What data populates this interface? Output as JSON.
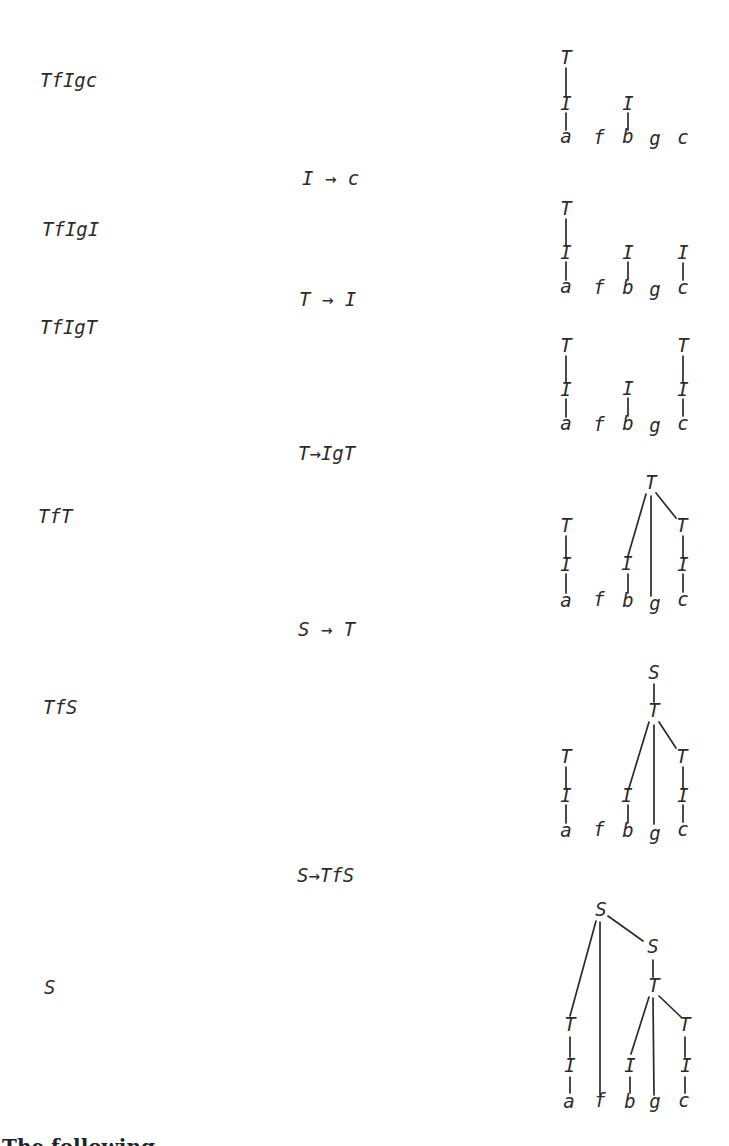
{
  "style": {
    "background": "#ffffff",
    "ink": "#2b2b2b",
    "edge_width": 1.7,
    "node_font_px": 19
  },
  "derivation": {
    "terminal_string": "afbgc",
    "terminals": [
      "a",
      "f",
      "b",
      "g",
      "c"
    ],
    "steps": [
      {
        "form": "TfIgc"
      },
      {
        "form": "TfIgI"
      },
      {
        "form": "TfIgT"
      },
      {
        "form": "TfT"
      },
      {
        "form": "TfS"
      },
      {
        "form": "S"
      }
    ],
    "rules": [
      {
        "text": "I → c"
      },
      {
        "text": "T → I"
      },
      {
        "text": "T→IgT"
      },
      {
        "text": "S → T"
      },
      {
        "text": "S→TfS"
      }
    ]
  },
  "caption": {
    "visible_fragment": "The following"
  },
  "trees": [
    {
      "name": "tree-step-1-TfIgc",
      "nodes": [
        {
          "label": "T",
          "x": 566,
          "y": 64
        },
        {
          "label": "I",
          "x": 566,
          "y": 110
        },
        {
          "label": "a",
          "x": 566,
          "y": 143
        },
        {
          "label": "f",
          "x": 599,
          "y": 144
        },
        {
          "label": "I",
          "x": 628,
          "y": 110
        },
        {
          "label": "b",
          "x": 628,
          "y": 143
        },
        {
          "label": "g",
          "x": 655,
          "y": 145
        },
        {
          "label": "c",
          "x": 683,
          "y": 144
        }
      ],
      "edges": [
        [
          566,
          68,
          566,
          96
        ],
        [
          566,
          113,
          566,
          130
        ],
        [
          628,
          113,
          628,
          130
        ]
      ]
    },
    {
      "name": "tree-step-2-TfIgI",
      "nodes": [
        {
          "label": "T",
          "x": 566,
          "y": 215
        },
        {
          "label": "I",
          "x": 566,
          "y": 259
        },
        {
          "label": "a",
          "x": 566,
          "y": 293
        },
        {
          "label": "f",
          "x": 599,
          "y": 294
        },
        {
          "label": "I",
          "x": 628,
          "y": 259
        },
        {
          "label": "b",
          "x": 628,
          "y": 294
        },
        {
          "label": "g",
          "x": 655,
          "y": 296
        },
        {
          "label": "I",
          "x": 683,
          "y": 259
        },
        {
          "label": "c",
          "x": 683,
          "y": 294
        }
      ],
      "edges": [
        [
          566,
          219,
          566,
          245
        ],
        [
          566,
          262,
          566,
          280
        ],
        [
          628,
          262,
          628,
          280
        ],
        [
          683,
          263,
          683,
          280
        ]
      ]
    },
    {
      "name": "tree-step-3-TfIgT",
      "nodes": [
        {
          "label": "T",
          "x": 566,
          "y": 352
        },
        {
          "label": "I",
          "x": 566,
          "y": 396
        },
        {
          "label": "a",
          "x": 566,
          "y": 430
        },
        {
          "label": "f",
          "x": 599,
          "y": 431
        },
        {
          "label": "I",
          "x": 628,
          "y": 395
        },
        {
          "label": "b",
          "x": 628,
          "y": 430
        },
        {
          "label": "g",
          "x": 655,
          "y": 432
        },
        {
          "label": "T",
          "x": 683,
          "y": 352
        },
        {
          "label": "I",
          "x": 683,
          "y": 396
        },
        {
          "label": "c",
          "x": 683,
          "y": 430
        }
      ],
      "edges": [
        [
          566,
          356,
          566,
          382
        ],
        [
          566,
          399,
          566,
          417
        ],
        [
          628,
          398,
          628,
          416
        ],
        [
          683,
          356,
          683,
          382
        ],
        [
          683,
          399,
          683,
          416
        ]
      ]
    },
    {
      "name": "tree-step-4-TfT",
      "nodes": [
        {
          "label": "T",
          "x": 651,
          "y": 489
        },
        {
          "label": "T",
          "x": 566,
          "y": 532
        },
        {
          "label": "I",
          "x": 566,
          "y": 571
        },
        {
          "label": "a",
          "x": 566,
          "y": 607
        },
        {
          "label": "f",
          "x": 599,
          "y": 606
        },
        {
          "label": "I",
          "x": 627,
          "y": 570
        },
        {
          "label": "b",
          "x": 628,
          "y": 607
        },
        {
          "label": "g",
          "x": 655,
          "y": 610
        },
        {
          "label": "T",
          "x": 682,
          "y": 532
        },
        {
          "label": "I",
          "x": 683,
          "y": 571
        },
        {
          "label": "c",
          "x": 683,
          "y": 606
        }
      ],
      "edges": [
        [
          646,
          494,
          628,
          556
        ],
        [
          651,
          496,
          651,
          596
        ],
        [
          656,
          493,
          676,
          518
        ],
        [
          566,
          536,
          566,
          558
        ],
        [
          566,
          574,
          566,
          593
        ],
        [
          628,
          574,
          628,
          593
        ],
        [
          683,
          536,
          683,
          557
        ],
        [
          683,
          574,
          683,
          592
        ]
      ]
    },
    {
      "name": "tree-step-5-TfS",
      "nodes": [
        {
          "label": "S",
          "x": 654,
          "y": 679
        },
        {
          "label": "T",
          "x": 654,
          "y": 717
        },
        {
          "label": "T",
          "x": 566,
          "y": 763
        },
        {
          "label": "I",
          "x": 566,
          "y": 802
        },
        {
          "label": "a",
          "x": 566,
          "y": 837
        },
        {
          "label": "f",
          "x": 599,
          "y": 836
        },
        {
          "label": "I",
          "x": 627,
          "y": 802
        },
        {
          "label": "b",
          "x": 628,
          "y": 837
        },
        {
          "label": "g",
          "x": 655,
          "y": 840
        },
        {
          "label": "T",
          "x": 682,
          "y": 763
        },
        {
          "label": "I",
          "x": 683,
          "y": 802
        },
        {
          "label": "c",
          "x": 683,
          "y": 836
        }
      ],
      "edges": [
        [
          654,
          684,
          654,
          702
        ],
        [
          649,
          722,
          629,
          788
        ],
        [
          654,
          725,
          654,
          824
        ],
        [
          659,
          722,
          676,
          748
        ],
        [
          566,
          767,
          566,
          789
        ],
        [
          566,
          805,
          566,
          823
        ],
        [
          628,
          805,
          628,
          823
        ],
        [
          683,
          767,
          683,
          789
        ],
        [
          683,
          805,
          683,
          822
        ]
      ]
    },
    {
      "name": "tree-step-6-S",
      "nodes": [
        {
          "label": "S",
          "x": 601,
          "y": 916
        },
        {
          "label": "S",
          "x": 653,
          "y": 953
        },
        {
          "label": "T",
          "x": 654,
          "y": 992
        },
        {
          "label": "T",
          "x": 570,
          "y": 1031
        },
        {
          "label": "I",
          "x": 570,
          "y": 1072
        },
        {
          "label": "a",
          "x": 569,
          "y": 1108
        },
        {
          "label": "f",
          "x": 600,
          "y": 1107
        },
        {
          "label": "I",
          "x": 630,
          "y": 1072
        },
        {
          "label": "b",
          "x": 630,
          "y": 1108
        },
        {
          "label": "g",
          "x": 655,
          "y": 1108
        },
        {
          "label": "T",
          "x": 685,
          "y": 1031
        },
        {
          "label": "I",
          "x": 686,
          "y": 1072
        },
        {
          "label": "c",
          "x": 684,
          "y": 1107
        }
      ],
      "edges": [
        [
          596,
          921,
          570,
          1016
        ],
        [
          600,
          922,
          600,
          1095
        ],
        [
          608,
          916,
          643,
          941
        ],
        [
          653,
          960,
          653,
          977
        ],
        [
          649,
          997,
          631,
          1054
        ],
        [
          653,
          998,
          654,
          1095
        ],
        [
          659,
          996,
          681,
          1017
        ],
        [
          570,
          1037,
          570,
          1057
        ],
        [
          570,
          1077,
          570,
          1093
        ],
        [
          630,
          1077,
          630,
          1093
        ],
        [
          685,
          1037,
          685,
          1057
        ],
        [
          685,
          1077,
          685,
          1093
        ]
      ]
    }
  ]
}
